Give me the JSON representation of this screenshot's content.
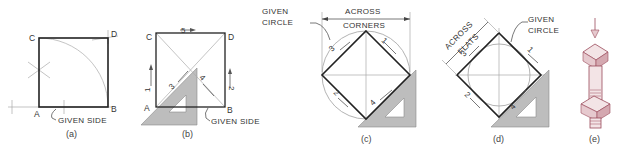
{
  "figure": {
    "panels": [
      {
        "id": "a",
        "caption": "(a)",
        "vertices": {
          "A": "A",
          "B": "B",
          "C": "C",
          "D": "D"
        },
        "labels": {
          "given_side": "GIVEN SIDE"
        }
      },
      {
        "id": "b",
        "caption": "(b)",
        "vertices": {
          "A": "A",
          "B": "B",
          "C": "C",
          "D": "D"
        },
        "labels": {
          "given_side": "GIVEN SIDE"
        },
        "step_numbers": [
          "1",
          "2",
          "3",
          "4",
          "5"
        ]
      },
      {
        "id": "c",
        "caption": "(c)",
        "labels": {
          "given_circle_1": "GIVEN",
          "given_circle_2": "CIRCLE",
          "across_1": "ACROSS",
          "across_2": "CORNERS"
        },
        "step_numbers": [
          "1",
          "2",
          "3",
          "4"
        ]
      },
      {
        "id": "d",
        "caption": "(d)",
        "labels": {
          "given_circle_1": "GIVEN",
          "given_circle_2": "CIRCLE",
          "across_1": "ACROSS",
          "across_2": "FLATS"
        },
        "step_numbers": [
          "1",
          "2",
          "3",
          "4"
        ]
      },
      {
        "id": "e",
        "caption": "(e)",
        "description": "Square-head bolt with square nut"
      }
    ],
    "colors": {
      "line": "#222222",
      "construction": "#aaaaaa",
      "triangle": "#bdbdbd",
      "bolt_outline": "#9a4a5a",
      "bolt_fill": "#f3e4e6"
    }
  }
}
